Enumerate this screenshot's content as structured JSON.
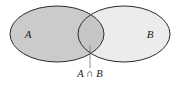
{
  "figure": {
    "name": "venn-diagram-intersection",
    "background_color": "#ffffff",
    "stroke_color": "#2b2b2b",
    "stroke_width": 1
  },
  "sets": {
    "left": {
      "label": "A",
      "fill_color": "#cbcbcb",
      "cx": 57,
      "cy": 34,
      "rx": 47,
      "ry": 28,
      "label_x": 28,
      "label_y": 38
    },
    "right": {
      "label": "B",
      "fill_color": "#ececec",
      "cx": 124,
      "cy": 34,
      "rx": 46,
      "ry": 28,
      "label_x": 150,
      "label_y": 38
    }
  },
  "intersection": {
    "label": "A ∩ B",
    "fill_color": "#c6c6c6",
    "label_x": 90,
    "label_y": 77,
    "leader_line": {
      "x1": 90,
      "y1": 45,
      "x2": 90,
      "y2": 68,
      "color": "#6e6e6e"
    }
  }
}
